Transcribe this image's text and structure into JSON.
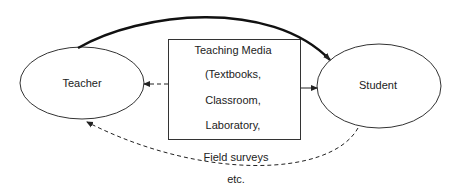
{
  "diagram": {
    "nodes": {
      "teacher": {
        "label": "Teacher"
      },
      "student": {
        "label": "Student"
      },
      "media": {
        "lines": [
          "Teaching Media",
          "(Textbooks,",
          "Classroom,",
          "Laboratory,"
        ]
      }
    },
    "outside_labels": [
      "Field surveys",
      "etc."
    ],
    "edges": [
      {
        "from": "teacher",
        "to": "student",
        "style": "thick-solid-curved"
      },
      {
        "from": "media",
        "to": "teacher",
        "style": "dashed"
      },
      {
        "from": "media",
        "to": "student",
        "style": "solid"
      },
      {
        "from": "student",
        "to": "teacher",
        "style": "dashed-curved"
      }
    ],
    "colors": {
      "stroke": "#222222",
      "background": "#ffffff"
    }
  }
}
